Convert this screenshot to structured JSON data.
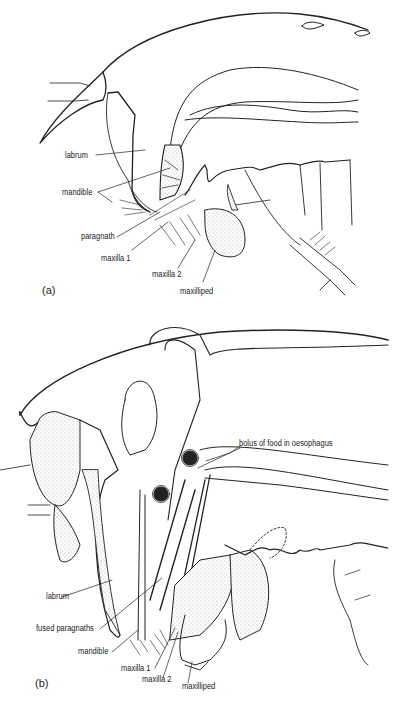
{
  "figure_a": {
    "panel_label": "(a)",
    "labels": [
      {
        "id": "labrum",
        "text": "labrum"
      },
      {
        "id": "mandible",
        "text": "mandible"
      },
      {
        "id": "paragnath",
        "text": "paragnath"
      },
      {
        "id": "maxilla1",
        "text": "maxilla 1"
      },
      {
        "id": "maxilla2",
        "text": "maxilla 2"
      },
      {
        "id": "maxilliped",
        "text": "maxilliped"
      }
    ]
  },
  "figure_b": {
    "panel_label": "(b)",
    "labels": [
      {
        "id": "bolus",
        "text": "bolus of food in oesophagus"
      },
      {
        "id": "labrum",
        "text": "labrum"
      },
      {
        "id": "fused_paragnaths",
        "text": "fused paragnaths"
      },
      {
        "id": "mandible",
        "text": "mandible"
      },
      {
        "id": "maxilla1",
        "text": "maxilla 1"
      },
      {
        "id": "maxilla2",
        "text": "maxilla 2"
      },
      {
        "id": "maxilliped",
        "text": "maxilliped"
      }
    ]
  },
  "colors": {
    "ink": "#222222",
    "stipple": "#d8d8d8",
    "background": "#ffffff"
  }
}
